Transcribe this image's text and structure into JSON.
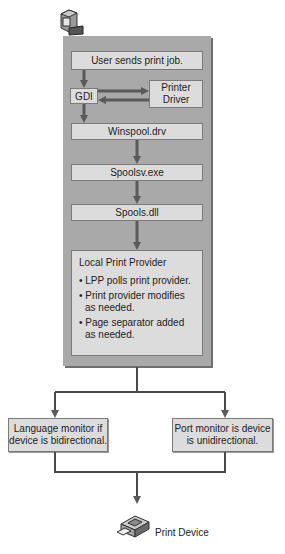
{
  "diagram": {
    "start_icon": "computer-icon",
    "steps": {
      "user_sends": "User sends print job.",
      "gdi": "GDI",
      "printer_driver": "Printer Driver",
      "winspool": "Winspool.drv",
      "spoolsv": "Spoolsv.exe",
      "spools": "Spools.dll"
    },
    "local_print_provider": {
      "title": "Local Print Provider",
      "bullets": [
        "• LPP polls print provider.",
        "• Print provider modifies as needed.",
        "• Page separator added as needed."
      ]
    },
    "branches": {
      "left": "Language monitor if device is bidirectional.",
      "right": "Port monitor is device is unidirectional."
    },
    "end": {
      "icon": "print-device-icon",
      "label": "Print Device"
    },
    "colors": {
      "panel": "#a9a9a9",
      "box": "#dcdcdc",
      "arrow": "#5a5a5a",
      "line": "#4a4a4a"
    }
  }
}
